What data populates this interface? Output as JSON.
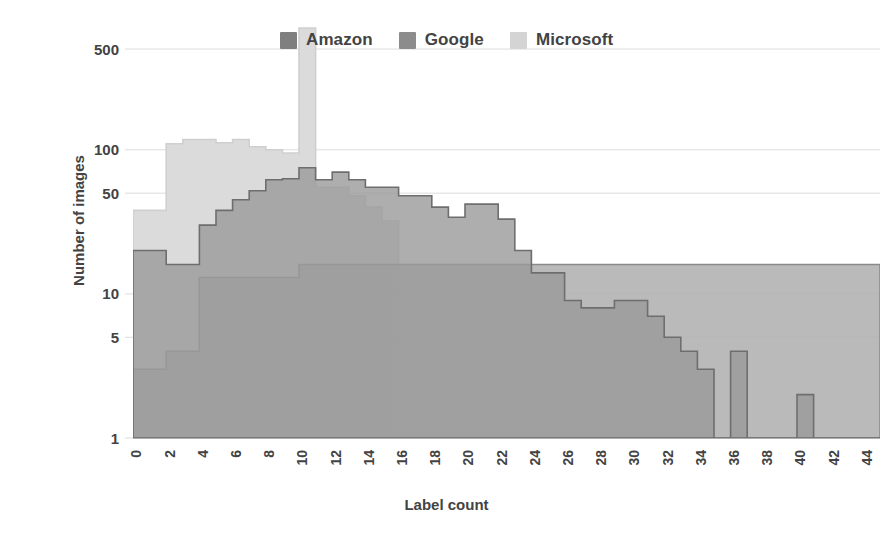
{
  "chart": {
    "ylabel": "Number of images",
    "xlabel": "Label count",
    "legend_position": "top-center"
  },
  "legend": {
    "items": [
      {
        "label": "Amazon",
        "color": "#7f7f7f"
      },
      {
        "label": "Google",
        "color": "#8c8c8c"
      },
      {
        "label": "Microsoft",
        "color": "#d4d4d4"
      }
    ]
  },
  "chart_data": {
    "type": "area",
    "title": "",
    "xlabel": "Label count",
    "ylabel": "Number of images",
    "xlim": [
      0,
      45
    ],
    "ylim": [
      1,
      700
    ],
    "yscale": "log",
    "grid": true,
    "legend_position": "top-center",
    "yticks": [
      1,
      5,
      10,
      50,
      100,
      500
    ],
    "ytick_labels": [
      "1",
      "5",
      "10",
      "50",
      "100",
      "500"
    ],
    "xticks": [
      0,
      2,
      4,
      6,
      8,
      10,
      12,
      14,
      16,
      18,
      20,
      22,
      24,
      26,
      28,
      30,
      32,
      34,
      36,
      38,
      40,
      42,
      44
    ],
    "xtick_labels": [
      "0",
      "2",
      "4",
      "6",
      "8",
      "10",
      "12",
      "14",
      "16",
      "18",
      "20",
      "22",
      "24",
      "26",
      "28",
      "30",
      "32",
      "34",
      "36",
      "38",
      "40",
      "42",
      "44"
    ],
    "x": [
      0,
      1,
      2,
      3,
      4,
      5,
      6,
      7,
      8,
      9,
      10,
      11,
      12,
      13,
      14,
      15,
      16,
      17,
      18,
      19,
      20,
      21,
      22,
      23,
      24,
      25,
      26,
      27,
      28,
      29,
      30,
      31,
      32,
      33,
      34,
      35,
      36,
      37,
      38,
      39,
      40,
      41,
      42,
      43,
      44
    ],
    "series": [
      {
        "name": "Amazon",
        "color": "#7f7f7f",
        "values": [
          3,
          3,
          4,
          4,
          13,
          13,
          13,
          13,
          16,
          16,
          16,
          16,
          16,
          16,
          16,
          16,
          16,
          16,
          16,
          16,
          16,
          16,
          16,
          16,
          16,
          16,
          16,
          16,
          16,
          16,
          16,
          16,
          16,
          16,
          16,
          16,
          16,
          16,
          16,
          16,
          16,
          16,
          16,
          16,
          16
        ]
      },
      {
        "name": "Google",
        "color": "#8c8c8c",
        "values": [
          20,
          20,
          16,
          16,
          30,
          30,
          38,
          38,
          45,
          52,
          62,
          63,
          63,
          58,
          52,
          52,
          52,
          40,
          40,
          34,
          42,
          42,
          28,
          20,
          18,
          18,
          18,
          8,
          8,
          7,
          7,
          8,
          8,
          8,
          8,
          7,
          7,
          6,
          6,
          5,
          5,
          4,
          4,
          3,
          3
        ]
      },
      {
        "name": "Microsoft",
        "color": "#d4d4d4",
        "values": [
          38,
          38,
          75,
          75,
          110,
          110,
          118,
          112,
          112,
          108,
          108,
          700,
          55,
          55,
          55,
          40,
          32,
          20,
          8,
          8,
          8,
          4,
          3,
          2,
          2,
          2,
          2,
          2,
          2,
          2,
          2,
          2,
          2,
          2,
          2,
          1,
          1,
          1,
          1,
          1,
          1,
          1,
          1,
          1,
          1
        ]
      }
    ],
    "note": "Three overlapping semi-transparent step/area histograms on a log y-axis. Microsoft shows a narrow spike at label count 10 exceeding 500. Isolated Google bars appear at 36 (~4) and 40-41 (~2)."
  },
  "render_spec": {
    "plot_left": 133,
    "plot_right": 880,
    "plot_top": 28,
    "plot_bottom": 438,
    "bin_min": 0,
    "bin_max": 45,
    "steps": {
      "amazon": [
        [
          0,
          3
        ],
        [
          1,
          3
        ],
        [
          2,
          4
        ],
        [
          3,
          4
        ],
        [
          4,
          13
        ],
        [
          9,
          13
        ],
        [
          10,
          16
        ],
        [
          45,
          16
        ]
      ],
      "google": [
        [
          0,
          20
        ],
        [
          2,
          16
        ],
        [
          4,
          30
        ],
        [
          5,
          38
        ],
        [
          6,
          45
        ],
        [
          7,
          52
        ],
        [
          8,
          62
        ],
        [
          9,
          63
        ],
        [
          10,
          75
        ],
        [
          11,
          62
        ],
        [
          12,
          70
        ],
        [
          13,
          62
        ],
        [
          14,
          55
        ],
        [
          15,
          55
        ],
        [
          16,
          48
        ],
        [
          17,
          48
        ],
        [
          18,
          40
        ],
        [
          19,
          34
        ],
        [
          20,
          42
        ],
        [
          21,
          42
        ],
        [
          22,
          33
        ],
        [
          23,
          20
        ],
        [
          24,
          14
        ],
        [
          25,
          14
        ],
        [
          26,
          9
        ],
        [
          27,
          8
        ],
        [
          28,
          8
        ],
        [
          29,
          9
        ],
        [
          30,
          9
        ],
        [
          31,
          7
        ],
        [
          32,
          5
        ],
        [
          33,
          4
        ],
        [
          34,
          3
        ],
        [
          35,
          1
        ],
        [
          36,
          4
        ],
        [
          37,
          1
        ],
        [
          40,
          2
        ],
        [
          41,
          1
        ],
        [
          44,
          1
        ],
        [
          45,
          1
        ]
      ],
      "microsoft": [
        [
          0,
          38
        ],
        [
          1,
          38
        ],
        [
          2,
          110
        ],
        [
          3,
          118
        ],
        [
          4,
          118
        ],
        [
          5,
          112
        ],
        [
          6,
          118
        ],
        [
          7,
          105
        ],
        [
          8,
          100
        ],
        [
          9,
          95
        ],
        [
          10,
          700
        ],
        [
          11,
          55
        ],
        [
          12,
          55
        ],
        [
          13,
          48
        ],
        [
          14,
          40
        ],
        [
          15,
          32
        ],
        [
          16,
          1
        ],
        [
          45,
          1
        ]
      ]
    }
  }
}
